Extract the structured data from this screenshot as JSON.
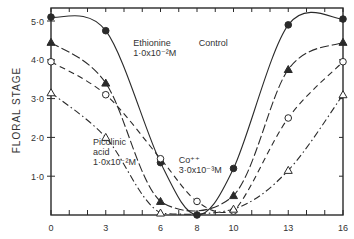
{
  "chart_data": {
    "type": "line",
    "title": "",
    "xlabel": "",
    "ylabel": "FLORAL STAGE",
    "xlim": [
      0,
      16
    ],
    "ylim": [
      0,
      5.2
    ],
    "x_ticks": [
      0,
      3,
      6,
      8,
      10,
      13,
      16
    ],
    "y_ticks": [
      1.0,
      2.0,
      3.0,
      4.0,
      5.0
    ],
    "y_tick_labels": [
      "1·0",
      "2·0",
      "3·0",
      "4·0",
      "5·0"
    ],
    "grid": false,
    "legend": "inline annotations",
    "series": [
      {
        "name": "Control",
        "marker": "filled-circle",
        "line": "solid",
        "x": [
          0,
          3,
          6,
          8,
          10,
          13,
          16
        ],
        "y": [
          5.1,
          4.75,
          1.35,
          0.0,
          1.2,
          4.9,
          5.05
        ]
      },
      {
        "name": "Ethionine 1·0x10⁻²M",
        "marker": "filled-triangle",
        "line": "long-dash",
        "x": [
          0,
          3,
          6,
          10,
          13,
          16
        ],
        "y": [
          4.45,
          3.4,
          0.35,
          0.5,
          3.75,
          4.45
        ]
      },
      {
        "name": "Co⁺⁺ 3·0x10⁻³M",
        "marker": "open-circle",
        "line": "dash",
        "x": [
          0,
          3,
          6,
          8,
          10,
          13,
          16
        ],
        "y": [
          3.95,
          3.1,
          1.45,
          0.35,
          0.1,
          2.5,
          3.95
        ]
      },
      {
        "name": "Picolinic acid 1·0x10⁻²M",
        "marker": "open-triangle",
        "line": "dash-dot",
        "x": [
          0,
          3,
          6,
          10,
          13,
          16
        ],
        "y": [
          3.15,
          2.0,
          0.05,
          0.15,
          1.15,
          3.1
        ]
      }
    ],
    "annotations": [
      {
        "lines": [
          "Ethionine",
          "1·0x10⁻²M"
        ],
        "x": 4.5,
        "y": 4.35
      },
      {
        "lines": [
          "Control"
        ],
        "x": 8.1,
        "y": 4.35
      },
      {
        "lines": [
          "Picolinic",
          "acid",
          "1·0x10⁻²M"
        ],
        "x": 2.3,
        "y": 1.8
      },
      {
        "lines": [
          "Co⁺⁺",
          "3·0x10⁻³M"
        ],
        "x": 7.0,
        "y": 1.35
      }
    ]
  }
}
